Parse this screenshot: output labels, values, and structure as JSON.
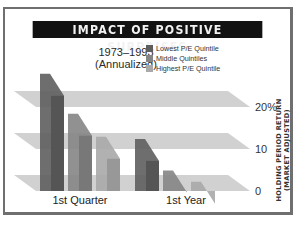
{
  "chart_data": {
    "type": "bar",
    "title": "IMPACT OF POSITIVE SURPRISES",
    "subtitle": [
      "1973–1993",
      "(Annualized)"
    ],
    "categories": [
      "1st Quarter",
      "1st Year"
    ],
    "series": [
      {
        "name": "Lowest P/E Quintile",
        "color": "#5e5e5e",
        "values": [
          26,
          10.5
        ]
      },
      {
        "name": "Middle Quintiles",
        "color": "#858585",
        "values": [
          16.5,
          3
        ]
      },
      {
        "name": "Highest P/E Quintile",
        "color": "#a9a9a9",
        "values": [
          11,
          0.3
        ]
      }
    ],
    "xlabel": "",
    "ylabel": [
      "HOLDING PERIOD RETURN",
      "(MARKET ADJUSTED)"
    ],
    "ylim": [
      0,
      26
    ],
    "yticks": [
      0,
      10,
      20
    ],
    "ytick_labels": [
      "0",
      "10",
      "20%"
    ],
    "grid": true,
    "legend_position": "top-right",
    "style": "3d-slanted"
  }
}
